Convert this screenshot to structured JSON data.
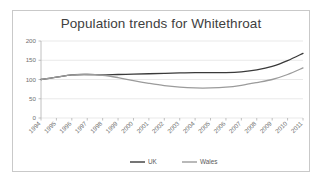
{
  "chart_data": {
    "type": "line",
    "title": "Population trends for Whitethroat",
    "xlabel": "",
    "ylabel": "",
    "ylim": [
      0,
      200
    ],
    "yticks": [
      0,
      50,
      100,
      150,
      200
    ],
    "grid": true,
    "legend_position": "bottom",
    "categories": [
      "1994",
      "1995",
      "1996",
      "1997",
      "1998",
      "1999",
      "2000",
      "2001",
      "2002",
      "2003",
      "2004",
      "2005",
      "2006",
      "2007",
      "2008",
      "2009",
      "2010",
      "2011"
    ],
    "series": [
      {
        "name": "UK",
        "color": "#3a3a3a",
        "values": [
          100,
          106,
          112,
          113,
          112,
          113,
          114,
          115,
          116,
          117,
          118,
          118,
          118,
          120,
          125,
          134,
          149,
          168
        ]
      },
      {
        "name": "Wales",
        "color": "#9b9b9b",
        "values": [
          100,
          106,
          112,
          113,
          111,
          105,
          97,
          90,
          84,
          80,
          78,
          78,
          80,
          85,
          92,
          100,
          113,
          130
        ]
      }
    ]
  },
  "legend": {
    "items": [
      {
        "label": "UK",
        "color": "#3a3a3a"
      },
      {
        "label": "Wales",
        "color": "#9b9b9b"
      }
    ]
  },
  "colors": {
    "frame_border": "#c9c9c9",
    "gridline": "#e0e0e0",
    "axis": "#b0b0b0",
    "tick_label": "#707070",
    "title": "#404040",
    "background": "#ffffff"
  }
}
